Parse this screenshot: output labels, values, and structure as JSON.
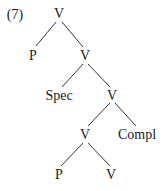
{
  "example_number": "(7)",
  "nodes": {
    "root": "V",
    "p1": "P",
    "v1": "V",
    "spec": "Spec",
    "v2": "V",
    "v3": "V",
    "compl": "Compl",
    "p2": "P",
    "v4": "V"
  },
  "edges": [
    [
      "root",
      "p1"
    ],
    [
      "root",
      "v1"
    ],
    [
      "v1",
      "spec"
    ],
    [
      "v1",
      "v2"
    ],
    [
      "v2",
      "v3"
    ],
    [
      "v2",
      "compl"
    ],
    [
      "v3",
      "p2"
    ],
    [
      "v3",
      "v4"
    ]
  ]
}
